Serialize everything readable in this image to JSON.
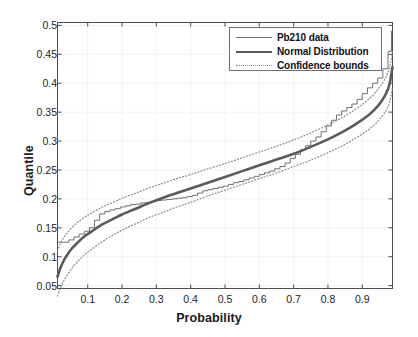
{
  "chart_data": {
    "type": "line",
    "title": "",
    "xlabel": "Probability",
    "ylabel": "Quantile",
    "xlim": [
      0.012,
      0.988
    ],
    "ylim": [
      0.045,
      0.505
    ],
    "xticks": [
      "0.1",
      "0.2",
      "0.3",
      "0.4",
      "0.5",
      "0.6",
      "0.7",
      "0.8",
      "0.9"
    ],
    "xtick_values": [
      0.1,
      0.2,
      0.3,
      0.4,
      0.5,
      0.6,
      0.7,
      0.8,
      0.9
    ],
    "yticks": [
      "0.05",
      "0.1",
      "0.15",
      "0.2",
      "0.25",
      "0.3",
      "0.35",
      "0.4",
      "0.45",
      "0.5"
    ],
    "ytick_values": [
      0.05,
      0.1,
      0.15,
      0.2,
      0.25,
      0.3,
      0.35,
      0.4,
      0.45,
      0.5
    ],
    "grid": true,
    "legend_position": "top-right",
    "series": [
      {
        "name": "Pb210 data",
        "style": "step-thin",
        "color": "#707070",
        "x": [
          0.015,
          0.03,
          0.045,
          0.06,
          0.075,
          0.09,
          0.105,
          0.12,
          0.135,
          0.15,
          0.165,
          0.18,
          0.195,
          0.21,
          0.225,
          0.24,
          0.255,
          0.27,
          0.285,
          0.3,
          0.315,
          0.33,
          0.345,
          0.36,
          0.375,
          0.39,
          0.405,
          0.42,
          0.435,
          0.45,
          0.465,
          0.48,
          0.495,
          0.51,
          0.525,
          0.54,
          0.555,
          0.57,
          0.585,
          0.6,
          0.615,
          0.63,
          0.645,
          0.66,
          0.675,
          0.69,
          0.705,
          0.72,
          0.735,
          0.75,
          0.765,
          0.78,
          0.795,
          0.81,
          0.825,
          0.84,
          0.855,
          0.87,
          0.885,
          0.9,
          0.915,
          0.93,
          0.945,
          0.96,
          0.975,
          0.985
        ],
        "y": [
          0.125,
          0.125,
          0.129,
          0.134,
          0.139,
          0.144,
          0.15,
          0.163,
          0.174,
          0.178,
          0.181,
          0.183,
          0.186,
          0.188,
          0.19,
          0.191,
          0.193,
          0.194,
          0.196,
          0.197,
          0.198,
          0.199,
          0.2,
          0.201,
          0.202,
          0.204,
          0.206,
          0.21,
          0.214,
          0.216,
          0.218,
          0.22,
          0.222,
          0.225,
          0.228,
          0.23,
          0.233,
          0.236,
          0.239,
          0.242,
          0.245,
          0.248,
          0.252,
          0.256,
          0.262,
          0.27,
          0.277,
          0.285,
          0.292,
          0.3,
          0.307,
          0.316,
          0.326,
          0.336,
          0.345,
          0.352,
          0.358,
          0.364,
          0.372,
          0.382,
          0.392,
          0.4,
          0.409,
          0.425,
          0.455,
          0.49
        ]
      },
      {
        "name": "Normal Distribution",
        "style": "smooth-thick",
        "color": "#5a5a5a",
        "mu": 0.238,
        "sigma": 0.077,
        "x": [
          0.012,
          0.02,
          0.03,
          0.04,
          0.055,
          0.07,
          0.09,
          0.11,
          0.14,
          0.17,
          0.2,
          0.24,
          0.28,
          0.32,
          0.36,
          0.4,
          0.45,
          0.5,
          0.55,
          0.6,
          0.65,
          0.7,
          0.75,
          0.8,
          0.84,
          0.88,
          0.91,
          0.935,
          0.955,
          0.97,
          0.98,
          0.988
        ],
        "y": [
          0.065,
          0.08,
          0.093,
          0.103,
          0.115,
          0.124,
          0.135,
          0.143,
          0.155,
          0.164,
          0.173,
          0.183,
          0.193,
          0.202,
          0.21,
          0.218,
          0.228,
          0.238,
          0.248,
          0.258,
          0.268,
          0.278,
          0.29,
          0.303,
          0.315,
          0.329,
          0.341,
          0.354,
          0.368,
          0.383,
          0.4,
          0.428
        ]
      },
      {
        "name": "Confidence bounds",
        "style": "dotted",
        "color": "#8a8a8a",
        "bound": "upper",
        "x": [
          0.012,
          0.02,
          0.03,
          0.04,
          0.055,
          0.07,
          0.09,
          0.11,
          0.14,
          0.17,
          0.2,
          0.24,
          0.28,
          0.32,
          0.36,
          0.4,
          0.45,
          0.5,
          0.55,
          0.6,
          0.65,
          0.7,
          0.75,
          0.8,
          0.84,
          0.88,
          0.91,
          0.935,
          0.955,
          0.97,
          0.98,
          0.988
        ],
        "y": [
          0.11,
          0.122,
          0.133,
          0.141,
          0.151,
          0.159,
          0.168,
          0.175,
          0.185,
          0.193,
          0.201,
          0.21,
          0.219,
          0.227,
          0.235,
          0.242,
          0.252,
          0.261,
          0.271,
          0.281,
          0.291,
          0.302,
          0.314,
          0.328,
          0.34,
          0.355,
          0.368,
          0.382,
          0.397,
          0.412,
          0.428,
          0.455
        ]
      },
      {
        "name": "Confidence bounds",
        "style": "dotted",
        "color": "#8a8a8a",
        "bound": "lower",
        "x": [
          0.012,
          0.02,
          0.03,
          0.04,
          0.055,
          0.07,
          0.09,
          0.11,
          0.14,
          0.17,
          0.2,
          0.24,
          0.28,
          0.32,
          0.36,
          0.4,
          0.45,
          0.5,
          0.55,
          0.6,
          0.65,
          0.7,
          0.75,
          0.8,
          0.84,
          0.88,
          0.91,
          0.935,
          0.955,
          0.97,
          0.98,
          0.988
        ],
        "y": [
          0.032,
          0.045,
          0.058,
          0.068,
          0.081,
          0.091,
          0.103,
          0.112,
          0.125,
          0.136,
          0.146,
          0.157,
          0.168,
          0.177,
          0.186,
          0.194,
          0.205,
          0.215,
          0.225,
          0.235,
          0.245,
          0.256,
          0.267,
          0.28,
          0.291,
          0.305,
          0.316,
          0.328,
          0.341,
          0.354,
          0.368,
          0.393
        ]
      }
    ]
  },
  "legend": {
    "items": [
      {
        "label": "Pb210 data",
        "sample": "thin-line-sample"
      },
      {
        "label": "Normal Distribution",
        "sample": "thick-line-sample"
      },
      {
        "label": "Confidence bounds",
        "sample": "dotted-line-sample"
      }
    ]
  },
  "axes": {
    "x_title": "Probability",
    "y_title": "Quantile"
  },
  "colors": {
    "data_line": "#707070",
    "normal_line": "#5a5a5a",
    "bounds_line": "#8a8a8a",
    "axis": "#4d4d4d",
    "grid": "#f2f2f2",
    "background": "#ffffff"
  }
}
